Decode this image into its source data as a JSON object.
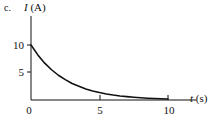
{
  "figure": {
    "part_label": "c.",
    "background_color": "#ffffff",
    "ink_color": "#111111"
  },
  "chart_data": {
    "type": "line",
    "title": "",
    "subtitle": "",
    "xlabel_symbol": "t",
    "xlabel_unit": "(s)",
    "xlabel": "t (s)",
    "ylabel_symbol": "I",
    "ylabel_unit": "(A)",
    "ylabel": "I (A)",
    "xlim": [
      0,
      11.5
    ],
    "ylim": [
      0,
      11.5
    ],
    "xticks": [
      0,
      5,
      10
    ],
    "xtick_labels": [
      "0",
      "5",
      "10"
    ],
    "yticks": [
      5,
      10
    ],
    "ytick_labels": [
      "5",
      "10"
    ],
    "grid": false,
    "legend": null,
    "annotations": [],
    "series": [
      {
        "name": "current-decay",
        "curve": "exponential decay",
        "color": "#111111",
        "x": [
          0.0,
          0.5,
          1.0,
          1.5,
          2.0,
          2.5,
          3.0,
          3.5,
          4.0,
          4.5,
          5.0,
          5.5,
          6.0,
          6.5,
          7.0,
          7.5,
          8.0,
          8.5,
          9.0,
          9.5,
          10.0
        ],
        "y": [
          10.0,
          8.2,
          6.7,
          5.5,
          4.5,
          3.7,
          3.0,
          2.5,
          2.0,
          1.65,
          1.35,
          1.1,
          0.9,
          0.74,
          0.61,
          0.5,
          0.41,
          0.33,
          0.27,
          0.22,
          0.18
        ]
      }
    ]
  }
}
